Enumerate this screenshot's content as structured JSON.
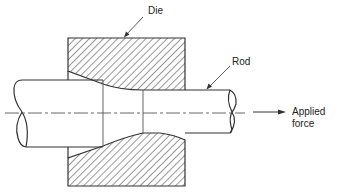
{
  "diagram": {
    "labels": {
      "die": "Die",
      "rod": "Rod",
      "applied_force_line1": "Applied",
      "applied_force_line2": "force"
    },
    "colors": {
      "stroke": "#333333",
      "hatch": "#444444",
      "centerline": "#555555",
      "background": "#ffffff"
    },
    "components": [
      "die-upper-half",
      "die-lower-half",
      "rod-entry-section",
      "rod-taper-section",
      "rod-exit-section",
      "centerline",
      "applied-force-arrow"
    ]
  }
}
